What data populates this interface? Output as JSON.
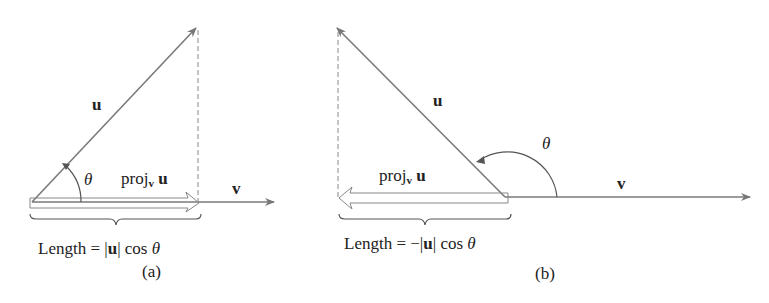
{
  "panels": [
    {
      "id": "a",
      "caption": "(a)",
      "vector_u_label": "u",
      "vector_v_label": "v",
      "angle_label": "θ",
      "proj_label": {
        "base": "proj",
        "sub": "v",
        "arg": "u"
      },
      "length_label": {
        "prefix": "Length = ",
        "sign": "",
        "bar_open": "|",
        "u": "u",
        "bar_close": "|",
        "suffix": " cos ",
        "theta": "θ"
      }
    },
    {
      "id": "b",
      "caption": "(b)",
      "vector_u_label": "u",
      "vector_v_label": "v",
      "angle_label": "θ",
      "proj_label": {
        "base": "proj",
        "sub": "v",
        "arg": "u"
      },
      "length_label": {
        "prefix": "Length = ",
        "sign": "−",
        "bar_open": "|",
        "u": "u",
        "bar_close": "|",
        "suffix": " cos ",
        "theta": "θ"
      }
    }
  ],
  "colors": {
    "line": "#7a7a7a",
    "text": "#222222"
  }
}
